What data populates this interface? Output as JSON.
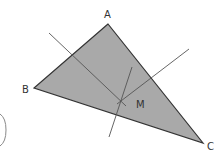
{
  "diagram": {
    "type": "triangle-with-perpendicular-bisectors",
    "vertices": [
      {
        "label": "A"
      },
      {
        "label": "B"
      },
      {
        "label": "C"
      }
    ],
    "intersection_point": {
      "label": "M"
    },
    "colors": {
      "triangle_fill": "#a9a9a9",
      "triangle_stroke": "#333333",
      "bisector_stroke": "#555555",
      "label": "#333333",
      "bracket": "#8a8a8a"
    }
  }
}
